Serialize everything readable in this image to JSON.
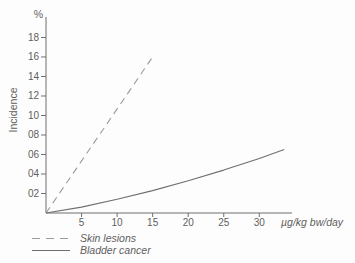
{
  "figure": {
    "background": "#fdfdfd",
    "text_color": "#5f5f5f",
    "axis_color": "#6f6f6f"
  },
  "chart_data": {
    "type": "line",
    "title": "",
    "xlabel": "µg/kg bw/day",
    "ylabel": "Incidence",
    "y_unit": "%",
    "xlim": [
      0,
      34.6
    ],
    "ylim": [
      0,
      20.1
    ],
    "grid": false,
    "legend_position": "below",
    "x_ticks": [
      5,
      10,
      15,
      20,
      25,
      30
    ],
    "x_tick_labels": [
      "5",
      "10",
      "15",
      "20",
      "25",
      "30"
    ],
    "y_ticks": [
      2,
      4,
      6,
      8,
      10,
      12,
      14,
      16,
      18
    ],
    "y_tick_labels": [
      "02",
      "04",
      "06",
      "08",
      "10",
      "12",
      "14",
      "16",
      "18"
    ],
    "series": [
      {
        "name": "Skin lesions",
        "style": "dashed",
        "color": "#9a9a9a",
        "points": [
          [
            0,
            0
          ],
          [
            15,
            16
          ]
        ]
      },
      {
        "name": "Bladder cancer",
        "style": "solid",
        "color": "#6f6f6f",
        "points": [
          [
            0,
            0
          ],
          [
            5,
            0.6
          ],
          [
            10,
            1.4
          ],
          [
            15,
            2.3
          ],
          [
            20,
            3.3
          ],
          [
            25,
            4.4
          ],
          [
            30,
            5.6
          ],
          [
            33.5,
            6.5
          ]
        ]
      }
    ]
  }
}
